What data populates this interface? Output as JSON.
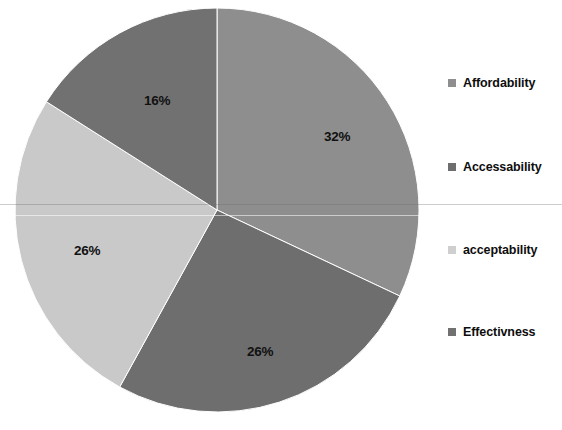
{
  "chart_data": {
    "type": "pie",
    "title": "",
    "labels": [
      "Affordability",
      "Accessability",
      "acceptability",
      "Effectivness"
    ],
    "values": [
      32,
      26,
      26,
      16
    ],
    "value_labels": [
      "32%",
      "26%",
      "26%",
      "16%"
    ],
    "units": "percent",
    "colors": [
      "#8e8e8e",
      "#6e6e6e",
      "#c9c9c9",
      "#717171"
    ],
    "legend_position": "right",
    "grid": false,
    "start_angle_deg": 0,
    "direction": "clockwise",
    "slices": [
      {
        "label": "Affordability",
        "value": 32,
        "value_label": "32%",
        "color": "#8e8e8e",
        "start_deg": 0,
        "end_deg": 115.2,
        "label_x": 324,
        "label_y": 129
      },
      {
        "label": "Accessability",
        "value": 26,
        "value_label": "26%",
        "color": "#6e6e6e",
        "start_deg": 115.2,
        "end_deg": 208.8,
        "label_x": 247,
        "label_y": 344
      },
      {
        "label": "acceptability",
        "value": 26,
        "value_label": "26%",
        "color": "#c9c9c9",
        "start_deg": 208.8,
        "end_deg": 302.4,
        "label_x": 74,
        "label_y": 243
      },
      {
        "label": "Effectivness",
        "value": 16,
        "value_label": "16%",
        "color": "#717171",
        "start_deg": 302.4,
        "end_deg": 360,
        "label_x": 144,
        "label_y": 93
      }
    ],
    "geometry": {
      "center_x": 217,
      "center_y": 210,
      "radius": 202
    }
  },
  "legend": {
    "items": [
      {
        "label": "Affordability",
        "color": "#8e8e8e",
        "top": 76
      },
      {
        "label": "Accessability",
        "color": "#6e6e6e",
        "top": 160
      },
      {
        "label": "acceptability",
        "color": "#cfcfcf",
        "top": 243
      },
      {
        "label": "Effectivness",
        "color": "#717171",
        "top": 325
      }
    ]
  }
}
